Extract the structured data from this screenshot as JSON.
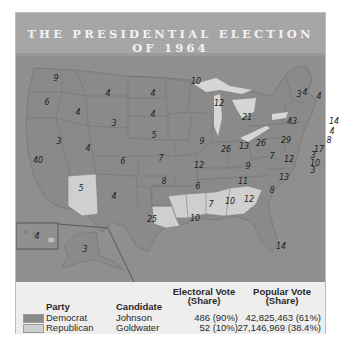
{
  "title": {
    "line1": "THE PRESIDENTIAL ELECTION",
    "line2": "OF 1964"
  },
  "colors": {
    "democrat": "#8a8a8a",
    "republican": "#cfcfcf",
    "water": "#8f8f8f",
    "lakes": "#d6d6d6",
    "title_bar": "#a6a6a6",
    "legend_bg": "#eeeeee"
  },
  "map": {
    "states": [
      {
        "abbr": "WA",
        "ev": "9",
        "party": "democrat"
      },
      {
        "abbr": "OR",
        "ev": "6",
        "party": "democrat"
      },
      {
        "abbr": "CA",
        "ev": "40",
        "party": "democrat"
      },
      {
        "abbr": "ID",
        "ev": "4",
        "party": "democrat"
      },
      {
        "abbr": "NV",
        "ev": "3",
        "party": "democrat"
      },
      {
        "abbr": "MT",
        "ev": "4",
        "party": "democrat"
      },
      {
        "abbr": "WY",
        "ev": "3",
        "party": "democrat"
      },
      {
        "abbr": "UT",
        "ev": "4",
        "party": "democrat"
      },
      {
        "abbr": "AZ",
        "ev": "5",
        "party": "republican"
      },
      {
        "abbr": "CO",
        "ev": "6",
        "party": "democrat"
      },
      {
        "abbr": "NM",
        "ev": "4",
        "party": "democrat"
      },
      {
        "abbr": "ND",
        "ev": "4",
        "party": "democrat"
      },
      {
        "abbr": "SD",
        "ev": "4",
        "party": "democrat"
      },
      {
        "abbr": "NE",
        "ev": "5",
        "party": "democrat"
      },
      {
        "abbr": "KS",
        "ev": "7",
        "party": "democrat"
      },
      {
        "abbr": "OK",
        "ev": "8",
        "party": "democrat"
      },
      {
        "abbr": "TX",
        "ev": "25",
        "party": "democrat"
      },
      {
        "abbr": "MN",
        "ev": "10",
        "party": "democrat"
      },
      {
        "abbr": "IA",
        "ev": "9",
        "party": "democrat"
      },
      {
        "abbr": "MO",
        "ev": "12",
        "party": "democrat"
      },
      {
        "abbr": "AR",
        "ev": "6",
        "party": "democrat"
      },
      {
        "abbr": "LA",
        "ev": "10",
        "party": "republican"
      },
      {
        "abbr": "WI",
        "ev": "12",
        "party": "democrat"
      },
      {
        "abbr": "IL",
        "ev": "26",
        "party": "democrat"
      },
      {
        "abbr": "MI",
        "ev": "21",
        "party": "democrat"
      },
      {
        "abbr": "IN",
        "ev": "13",
        "party": "democrat"
      },
      {
        "abbr": "OH",
        "ev": "26",
        "party": "democrat"
      },
      {
        "abbr": "KY",
        "ev": "9",
        "party": "democrat"
      },
      {
        "abbr": "TN",
        "ev": "11",
        "party": "democrat"
      },
      {
        "abbr": "MS",
        "ev": "7",
        "party": "republican"
      },
      {
        "abbr": "AL",
        "ev": "10",
        "party": "republican"
      },
      {
        "abbr": "GA",
        "ev": "12",
        "party": "republican"
      },
      {
        "abbr": "FL",
        "ev": "14",
        "party": "democrat"
      },
      {
        "abbr": "SC",
        "ev": "8",
        "party": "republican"
      },
      {
        "abbr": "NC",
        "ev": "13",
        "party": "democrat"
      },
      {
        "abbr": "VA",
        "ev": "12",
        "party": "democrat"
      },
      {
        "abbr": "WV",
        "ev": "7",
        "party": "democrat"
      },
      {
        "abbr": "PA",
        "ev": "29",
        "party": "democrat"
      },
      {
        "abbr": "NY",
        "ev": "43",
        "party": "democrat"
      },
      {
        "abbr": "VT",
        "ev": "3",
        "party": "democrat"
      },
      {
        "abbr": "NH",
        "ev": "4",
        "party": "democrat"
      },
      {
        "abbr": "ME",
        "ev": "4",
        "party": "democrat"
      },
      {
        "abbr": "MA",
        "ev": "14",
        "party": "democrat"
      },
      {
        "abbr": "RI",
        "ev": "4",
        "party": "democrat"
      },
      {
        "abbr": "CT",
        "ev": "8",
        "party": "democrat"
      },
      {
        "abbr": "NJ",
        "ev": "17",
        "party": "democrat"
      },
      {
        "abbr": "DE",
        "ev": "3",
        "party": "democrat"
      },
      {
        "abbr": "MD",
        "ev": "10",
        "party": "democrat"
      },
      {
        "abbr": "DC",
        "ev": "3",
        "party": "democrat"
      },
      {
        "abbr": "HI",
        "ev": "4",
        "party": "democrat"
      },
      {
        "abbr": "AK",
        "ev": "3",
        "party": "democrat"
      }
    ]
  },
  "legend": {
    "headers": {
      "party": "Party",
      "candidate": "Candidate",
      "electoral_line1": "Electoral Vote",
      "electoral_line2": "(Share)",
      "popular_line1": "Popular Vote",
      "popular_line2": "(Share)"
    },
    "rows": [
      {
        "party": "Democrat",
        "candidate": "Johnson",
        "electoral": "486 (90%)",
        "popular": "42,825,463 (61%)"
      },
      {
        "party": "Republican",
        "candidate": "Goldwater",
        "electoral": "52 (10%)",
        "popular": "27,146,969 (38.4%)"
      }
    ]
  }
}
